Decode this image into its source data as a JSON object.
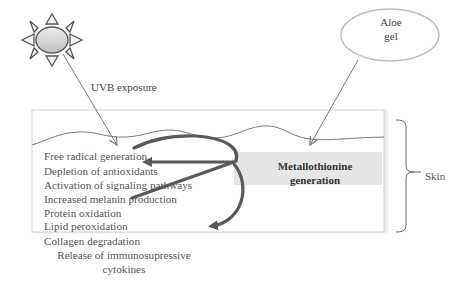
{
  "diagram": {
    "sources": {
      "sun": {
        "icon": "sun-icon",
        "label": "UVB exposure"
      },
      "aloe": {
        "line1": "Aloe",
        "line2": "gel"
      }
    },
    "central_node": {
      "line1": "Metallothionine",
      "line2": "generation"
    },
    "effects": [
      "Free radical generation",
      "Depletion of antioxidants",
      "Activation of signaling pathways",
      "Increased melanin production",
      "Protein oxidation",
      "Lipid peroxidation",
      "Collagen degradation",
      "Release of immunosupressive cytokines"
    ],
    "effects_last_line2": "cytokines",
    "effects_last_line1": "Release of immunosupressive",
    "bracket_label": "Skin",
    "colors": {
      "arrow": "#595959",
      "skin_box_border": "#cfcfcf",
      "central_box_fill": "#e6e6e6",
      "sun_fill": "#d9d9d9",
      "text": "#555555"
    }
  }
}
